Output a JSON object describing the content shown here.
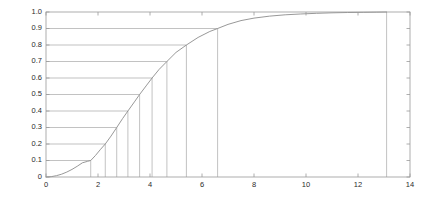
{
  "figure": {
    "background_color": "#ffffff",
    "axes_color": "#9a9a9a",
    "curve_color": "#8c8c8c",
    "quantile_line_color": "#a8a8a8",
    "tick_label_color": "#2b2b2b"
  },
  "chart_data": {
    "type": "line",
    "title": "",
    "subtitle": "",
    "xlabel": "",
    "ylabel": "",
    "xlim": [
      0,
      14
    ],
    "ylim": [
      0,
      1.0
    ],
    "grid": false,
    "legend": null,
    "legend_position": "none",
    "xticks": [
      0,
      2,
      4,
      6,
      8,
      10,
      12,
      14
    ],
    "xticklabels": [
      "0",
      "2",
      "4",
      "6",
      "8",
      "10",
      "12",
      "14"
    ],
    "yticks": [
      0,
      0.1,
      0.2,
      0.3,
      0.4,
      0.5,
      0.6,
      0.7,
      0.8,
      0.9,
      1.0
    ],
    "yticklabels": [
      "0",
      "0.1",
      "0.2",
      "0.3",
      "0.4",
      "0.5",
      "0.6",
      "0.7",
      "0.8",
      "0.9",
      "1.0"
    ],
    "series": [
      {
        "name": "cumulative distribution function",
        "x": [
          0.0,
          0.2,
          0.4,
          0.6,
          0.8,
          1.0,
          1.2,
          1.4,
          1.6,
          1.72,
          1.9,
          2.1,
          2.28,
          2.5,
          2.72,
          2.95,
          3.15,
          3.4,
          3.6,
          3.85,
          4.08,
          4.35,
          4.65,
          5.0,
          5.4,
          5.85,
          6.3,
          6.6,
          7.0,
          7.5,
          8.0,
          8.6,
          9.2,
          9.8,
          10.4,
          11.0,
          11.6,
          12.2,
          12.7,
          13.1
        ],
        "y": [
          0.0,
          0.002,
          0.008,
          0.017,
          0.03,
          0.046,
          0.065,
          0.086,
          0.095,
          0.1,
          0.13,
          0.168,
          0.2,
          0.248,
          0.3,
          0.355,
          0.4,
          0.455,
          0.5,
          0.552,
          0.6,
          0.652,
          0.7,
          0.755,
          0.8,
          0.846,
          0.882,
          0.9,
          0.925,
          0.948,
          0.963,
          0.975,
          0.983,
          0.988,
          0.992,
          0.995,
          0.997,
          0.998,
          0.999,
          1.0
        ]
      }
    ],
    "annotations": {
      "description": "Decile quantile lines: horizontal segment from y-axis to curve at each probability level, then vertical segment from curve down to x-axis.",
      "quantile_levels": [
        0.1,
        0.2,
        0.3,
        0.4,
        0.5,
        0.6,
        0.7,
        0.8,
        0.9
      ],
      "quantile_values": [
        1.72,
        2.28,
        2.72,
        3.15,
        3.6,
        4.08,
        4.65,
        5.4,
        6.6
      ],
      "max_line": {
        "label": "1.0",
        "level": 1.0,
        "value": 13.1
      }
    }
  }
}
